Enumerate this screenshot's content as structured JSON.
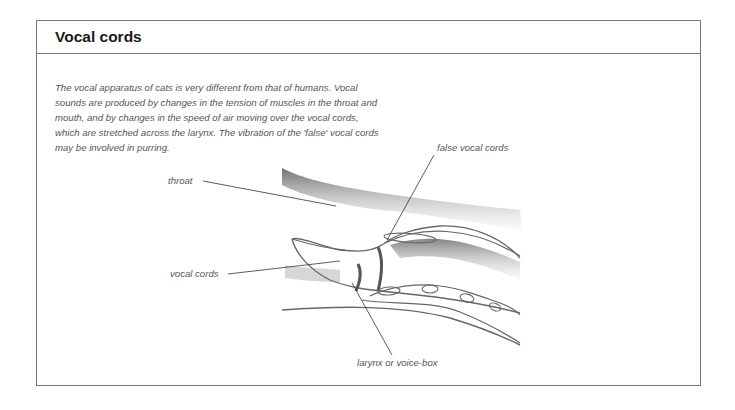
{
  "panel": {
    "title": "Vocal cords",
    "description": "The vocal apparatus of cats is very different from that of humans. Vocal sounds are produced by changes in the tension of muscles in the throat and mouth, and by changes in the speed of air moving over the vocal cords, which are stretched across the larynx. The vibration of the 'false' vocal cords may be involved in purring."
  },
  "diagram": {
    "labels": {
      "throat": "throat",
      "false_vocal_cords": "false vocal cords",
      "vocal_cords": "vocal cords",
      "larynx": "larynx or voice-box"
    },
    "colors": {
      "line": "#555555",
      "shade": "#8a8a8a",
      "border": "#777777"
    }
  }
}
